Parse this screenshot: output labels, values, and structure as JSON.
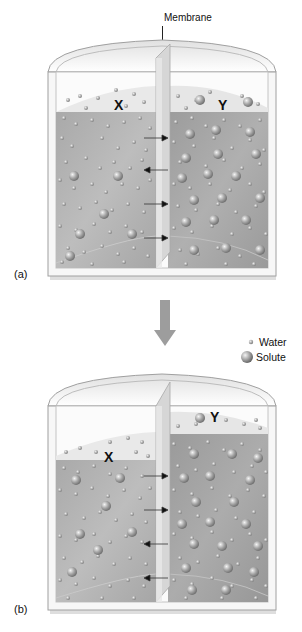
{
  "title_label": "Membrane",
  "legend": {
    "items": [
      {
        "label": "Water",
        "icon": "small-sphere"
      },
      {
        "label": "Solute",
        "icon": "large-sphere"
      }
    ]
  },
  "panels": [
    {
      "id": "a",
      "label": "(a)",
      "left_side_label": "X",
      "right_side_label": "Y",
      "fluid_levels": "equal",
      "arrows": [
        "right",
        "left",
        "right",
        "right"
      ]
    },
    {
      "id": "b",
      "label": "(b)",
      "left_side_label": "X",
      "right_side_label": "Y",
      "fluid_levels": "right higher",
      "arrows": [
        "right",
        "right",
        "left",
        "left"
      ]
    }
  ],
  "transition_arrow": "down",
  "colors": {
    "fluid_left": "#b2b2b2",
    "fluid_right": "#a4a4a4",
    "tank_outline": "#9a9a9a",
    "membrane": "#d8d8d8",
    "arrow": "#9d9d9d"
  }
}
